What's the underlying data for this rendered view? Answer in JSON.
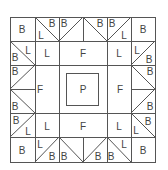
{
  "diagram": {
    "type": "quilt-block",
    "colors": {
      "line": "#555555",
      "text": "#444444",
      "background": "#ffffff"
    },
    "labels": {
      "B": "B",
      "L": "L",
      "F": "F",
      "P": "P"
    },
    "pieces": [
      {
        "id": "tl-corner",
        "label": "B"
      },
      {
        "id": "top-left-tri-l",
        "label": "L"
      },
      {
        "id": "top-left-tri-b",
        "label": "B"
      },
      {
        "id": "top-right-tri-b",
        "label": "B"
      },
      {
        "id": "top-right-tri-l",
        "label": "L"
      },
      {
        "id": "tr-corner",
        "label": "B"
      },
      {
        "id": "left-top-tri-b",
        "label": "B"
      },
      {
        "id": "left-top-tri-l",
        "label": "L"
      },
      {
        "id": "inner-tl-l",
        "label": "L"
      },
      {
        "id": "top-center-f",
        "label": "F"
      },
      {
        "id": "inner-tr-l",
        "label": "L"
      },
      {
        "id": "right-top-tri-l",
        "label": "L"
      },
      {
        "id": "right-top-tri-b",
        "label": "B"
      },
      {
        "id": "left-upper-b",
        "label": "B"
      },
      {
        "id": "left-f",
        "label": "F"
      },
      {
        "id": "center-p",
        "label": "P"
      },
      {
        "id": "right-f",
        "label": "F"
      },
      {
        "id": "right-upper-b",
        "label": "B"
      },
      {
        "id": "left-lower-b",
        "label": "B"
      },
      {
        "id": "right-lower-b",
        "label": "B"
      },
      {
        "id": "left-bottom-tri-b",
        "label": "B"
      },
      {
        "id": "left-bottom-tri-l",
        "label": "L"
      },
      {
        "id": "inner-bl-l",
        "label": "L"
      },
      {
        "id": "bottom-center-f",
        "label": "F"
      },
      {
        "id": "inner-br-l",
        "label": "L"
      },
      {
        "id": "right-bottom-tri-l",
        "label": "L"
      },
      {
        "id": "right-bottom-tri-b",
        "label": "B"
      },
      {
        "id": "bl-corner",
        "label": "B"
      },
      {
        "id": "bottom-left-tri-l",
        "label": "L"
      },
      {
        "id": "bottom-left-tri-b",
        "label": "B"
      },
      {
        "id": "bottom-right-tri-b",
        "label": "B"
      },
      {
        "id": "bottom-right-tri-l",
        "label": "L"
      },
      {
        "id": "br-corner",
        "label": "B"
      }
    ]
  }
}
